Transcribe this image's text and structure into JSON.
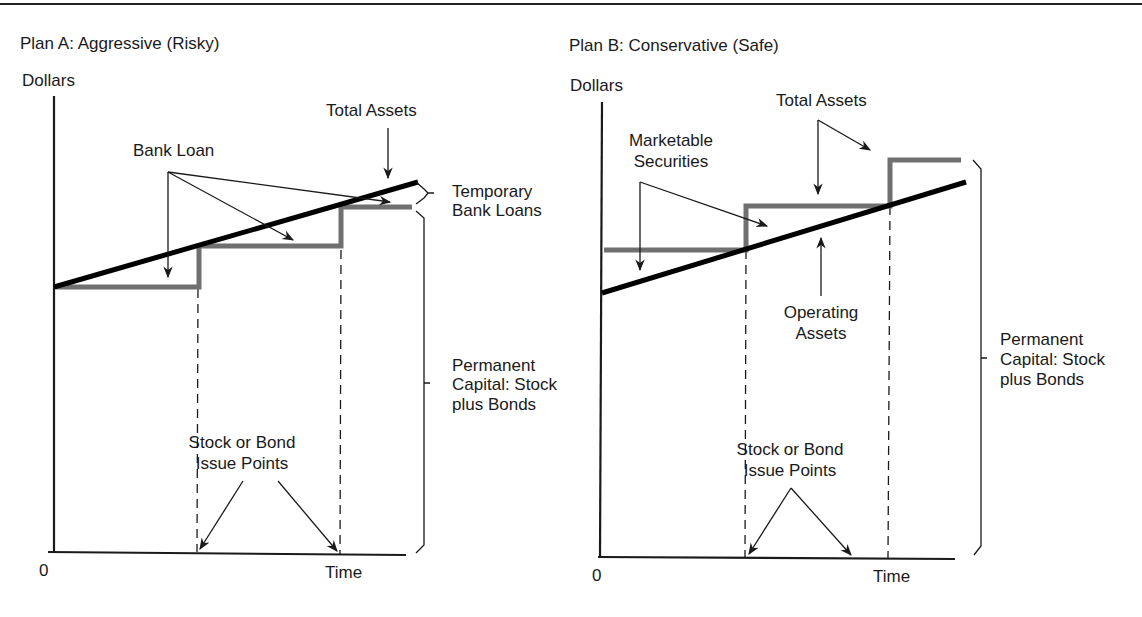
{
  "figure": {
    "top_rule": true,
    "colors": {
      "ink": "#1a1a1a",
      "total_assets_line": "#707070",
      "trend_line": "#000000",
      "background": "#ffffff"
    }
  },
  "panels": [
    {
      "id": "plan-a",
      "title": "Plan A: Aggressive (Risky)",
      "y_axis_label": "Dollars",
      "x_axis_label": "Time",
      "origin_label": "0",
      "labels": {
        "bank_loan": "Bank Loan",
        "total_assets": "Total Assets",
        "temporary_bank_loans": "Temporary Bank Loans",
        "temporary_line1": "Temporary",
        "temporary_line2": "Bank Loans",
        "permanent_line1": "Permanent",
        "permanent_line2": "Capital: Stock",
        "permanent_line3": "plus Bonds",
        "issue_line1": "Stock or Bond",
        "issue_line2": "Issue Points"
      },
      "geometry": {
        "y_axis": {
          "x": 54,
          "y1": 96,
          "y2": 552
        },
        "x_axis": {
          "y": 552,
          "x1": 48,
          "x2": 406
        },
        "trend_line": {
          "x1": 54,
          "y1": 287,
          "x2": 418,
          "y2": 182
        },
        "total_assets_steps": [
          [
            56,
            287
          ],
          [
            199,
            287
          ],
          [
            199,
            246
          ],
          [
            341,
            246
          ],
          [
            341,
            207
          ],
          [
            412,
            207
          ]
        ],
        "issue_points_x": [
          197,
          340
        ],
        "dashed_top": [
          287,
          246
        ]
      }
    },
    {
      "id": "plan-b",
      "title": "Plan B: Conservative (Safe)",
      "y_axis_label": "Dollars",
      "x_axis_label": "Time",
      "origin_label": "0",
      "labels": {
        "marketable_line1": "Marketable",
        "marketable_line2": "Securities",
        "total_assets": "Total Assets",
        "operating_line1": "Operating",
        "operating_line2": "Assets",
        "permanent_line1": "Permanent",
        "permanent_line2": "Capital: Stock",
        "permanent_line3": "plus Bonds",
        "issue_line1": "Stock or Bond",
        "issue_line2": "Issue Points"
      },
      "geometry": {
        "y_axis": {
          "x": 602,
          "y1": 102,
          "y2": 557
        },
        "x_axis": {
          "y": 557,
          "x1": 598,
          "x2": 955
        },
        "trend_line": {
          "x1": 602,
          "y1": 293,
          "x2": 966,
          "y2": 182
        },
        "total_assets_steps": [
          [
            604,
            250
          ],
          [
            746,
            250
          ],
          [
            746,
            206
          ],
          [
            890,
            206
          ],
          [
            890,
            160
          ],
          [
            961,
            160
          ]
        ],
        "issue_points_x": [
          745,
          888
        ],
        "dashed_top": [
          248,
          204
        ]
      }
    }
  ]
}
